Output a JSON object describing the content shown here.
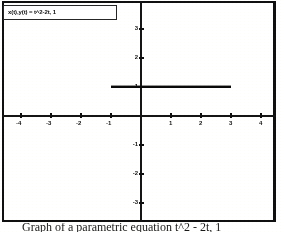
{
  "figure": {
    "equation_label": "x(t),y(t) = t^2-2t, 1",
    "caption": "Graph of a parametric equation t^2 - 2t, 1"
  },
  "chart_data": {
    "type": "line",
    "title": "x(t),y(t) = t^2-2t, 1",
    "xlabel": "",
    "ylabel": "",
    "xlim": [
      -5,
      4.6
    ],
    "ylim": [
      -3.6,
      3.6
    ],
    "grid": false,
    "legend": "none",
    "axis_style": "cartesian-cross",
    "x_ticks": [
      -5,
      -4,
      -3,
      -2,
      -1,
      1,
      2,
      3,
      4
    ],
    "x_tick_labels": [
      "-5",
      "-4",
      "-3",
      "-2",
      "-1",
      "1",
      "2",
      "3",
      "4"
    ],
    "y_ticks": [
      3,
      2,
      1,
      -1,
      -2,
      -3
    ],
    "y_tick_labels": [
      "3",
      "2",
      "1",
      "-1",
      "-2",
      "-3"
    ],
    "series": [
      {
        "name": "x(t),y(t) = t^2-2t, 1",
        "parametric": {
          "x": "t^2-2t",
          "y": "1"
        },
        "x": [
          -1,
          3
        ],
        "y": [
          1,
          1
        ],
        "description": "horizontal segment at y = 1 from x = -1 to x = 3"
      }
    ]
  },
  "ticks": {
    "x": [
      {
        "label": "-5",
        "value": -5
      },
      {
        "label": "-4",
        "value": -4
      },
      {
        "label": "-3",
        "value": -3
      },
      {
        "label": "-2",
        "value": -2
      },
      {
        "label": "-1",
        "value": -1
      },
      {
        "label": "1",
        "value": 1
      },
      {
        "label": "2",
        "value": 2
      },
      {
        "label": "3",
        "value": 3
      },
      {
        "label": "4",
        "value": 4
      }
    ],
    "y": [
      {
        "label": "3",
        "value": 3
      },
      {
        "label": "2",
        "value": 2
      },
      {
        "label": "1",
        "value": 1
      },
      {
        "label": "-1",
        "value": -1
      },
      {
        "label": "-2",
        "value": -2
      },
      {
        "label": "-3",
        "value": -3
      }
    ]
  },
  "colors": {
    "ink": "#151515",
    "curve": "#101010",
    "paper": "#fdfdfb"
  }
}
